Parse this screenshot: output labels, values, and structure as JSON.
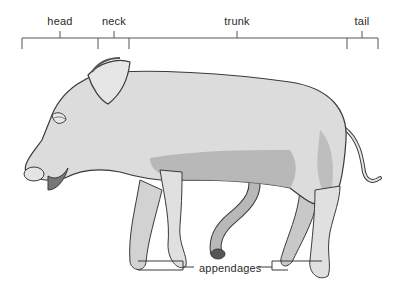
{
  "diagram": {
    "regions": [
      {
        "label": "head",
        "tick_x": 60,
        "start_x": 22,
        "end_x": 98
      },
      {
        "label": "neck",
        "tick_x": 114,
        "start_x": 98,
        "end_x": 129
      },
      {
        "label": "trunk",
        "tick_x": 237,
        "start_x": 129,
        "end_x": 347
      },
      {
        "label": "tail",
        "tick_x": 362,
        "start_x": 347,
        "end_x": 378
      }
    ],
    "callout": {
      "label": "appendages"
    },
    "colors": {
      "line": "#3a3a3a",
      "body_fill": "#dcdcdc",
      "shade": "#9a9a9a",
      "background": "#ffffff"
    }
  }
}
